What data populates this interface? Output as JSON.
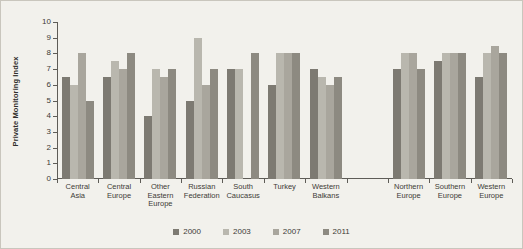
{
  "chart_data": {
    "type": "bar",
    "title": "",
    "subtitle": "",
    "xlabel": "",
    "ylabel": "Private Monitoring Index",
    "ylim": [
      0,
      10
    ],
    "ytick_labels": [
      "0",
      "1",
      "2",
      "3",
      "4",
      "5",
      "6",
      "7",
      "8",
      "9",
      "10"
    ],
    "ytick_values": [
      0,
      1,
      2,
      3,
      4,
      5,
      6,
      7,
      8,
      9,
      10
    ],
    "grid": false,
    "legend_position": "bottom",
    "categories": [
      "Central Asia",
      "Central Europe",
      "Other Eastern Europe",
      "Russian Federation",
      "South Caucasus",
      "Turkey",
      "Western Balkans",
      "",
      "Northern Europe",
      "Southern Europe",
      "Western Europe"
    ],
    "category_lines": [
      [
        "Central",
        "Asia"
      ],
      [
        "Central",
        "Europe"
      ],
      [
        "Other",
        "Eastern",
        "Europe"
      ],
      [
        "Russian",
        "Federation"
      ],
      [
        "South",
        "Caucasus"
      ],
      [
        "Turkey"
      ],
      [
        "Western",
        "Balkans"
      ],
      [
        ""
      ],
      [
        "Northern",
        "Europe"
      ],
      [
        "Southern",
        "Europe"
      ],
      [
        "Western",
        "Europe"
      ]
    ],
    "series": [
      {
        "name": "2000",
        "color": "#7d7a72",
        "values": [
          6.5,
          6.5,
          4,
          5,
          7,
          6,
          7,
          null,
          7,
          7.5,
          6.5
        ]
      },
      {
        "name": "2003",
        "color": "#b9b7ae",
        "values": [
          6,
          7.5,
          7,
          9,
          7,
          8,
          6.5,
          null,
          8,
          8,
          8
        ]
      },
      {
        "name": "2007",
        "color": "#a9a69d",
        "values": [
          8,
          7,
          6.5,
          6,
          null,
          8,
          6,
          null,
          8,
          8,
          8.5
        ]
      },
      {
        "name": "2011",
        "color": "#8d8a81",
        "values": [
          5,
          8,
          7,
          7,
          8,
          8,
          6.5,
          null,
          7,
          8,
          8
        ]
      }
    ],
    "legend": [
      {
        "label": "2000",
        "color": "#7d7a72"
      },
      {
        "label": "2003",
        "color": "#b9b7ae"
      },
      {
        "label": "2007",
        "color": "#a9a69d"
      },
      {
        "label": "2011",
        "color": "#8d8a81"
      }
    ]
  }
}
